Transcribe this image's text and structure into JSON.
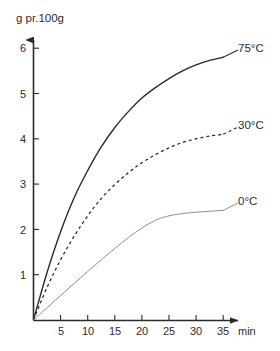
{
  "chart_data": {
    "type": "line",
    "title": "",
    "subtitle": "",
    "xlabel": "min",
    "ylabel": "g pr.100g",
    "xlim": [
      0,
      38
    ],
    "ylim": [
      0,
      6.4
    ],
    "grid": false,
    "legend_position": "right-inline-labels",
    "x_ticks": [
      5,
      10,
      15,
      20,
      25,
      30,
      35
    ],
    "y_ticks": [
      1,
      2,
      3,
      4,
      5,
      6
    ],
    "x": [
      0,
      2.5,
      5,
      7.5,
      10,
      12.5,
      15,
      17.5,
      20,
      22.5,
      25,
      27.5,
      30,
      32.5,
      35
    ],
    "series": [
      {
        "name": "75°C",
        "style": "solid",
        "color": "#2b2b2b",
        "width": 1.4,
        "values": [
          0,
          1.05,
          1.95,
          2.7,
          3.3,
          3.82,
          4.25,
          4.6,
          4.9,
          5.13,
          5.33,
          5.5,
          5.63,
          5.73,
          5.8
        ]
      },
      {
        "name": "30°C",
        "style": "dashed",
        "color": "#2b2b2b",
        "width": 1.3,
        "values": [
          0,
          0.72,
          1.33,
          1.85,
          2.3,
          2.68,
          2.99,
          3.25,
          3.47,
          3.65,
          3.8,
          3.92,
          4.0,
          4.06,
          4.1
        ]
      },
      {
        "name": "0°C",
        "style": "solid",
        "color": "#8a8f96",
        "width": 1.0,
        "values": [
          0,
          0.27,
          0.54,
          0.81,
          1.07,
          1.33,
          1.58,
          1.82,
          2.03,
          2.2,
          2.3,
          2.35,
          2.38,
          2.4,
          2.42
        ]
      }
    ],
    "annotations": [
      {
        "text": "75°C",
        "series": "75°C"
      },
      {
        "text": "30°C",
        "series": "30°C"
      },
      {
        "text": "0°C",
        "series": "0°C"
      }
    ]
  },
  "axes": {
    "y_title": "g pr.100g",
    "x_unit": "min",
    "y_tick_labels": [
      "1",
      "2",
      "3",
      "4",
      "5",
      "6"
    ],
    "x_tick_labels": [
      "5",
      "10",
      "15",
      "20",
      "25",
      "30",
      "35"
    ]
  },
  "series_labels": {
    "hot": "75°C",
    "mid": "30°C",
    "cold": "0°C"
  },
  "colors": {
    "axis": "#2b2b2b",
    "text": "#2b2b2b",
    "series_hot": "#2b2b2b",
    "series_mid": "#2b2b2b",
    "series_cold": "#8a8f96",
    "background": "#ffffff"
  }
}
